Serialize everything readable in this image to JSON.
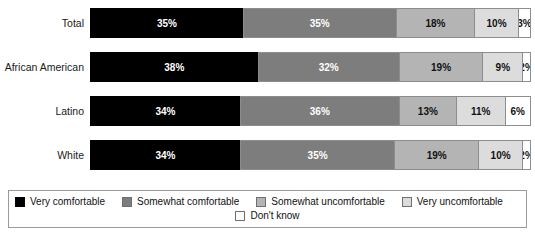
{
  "top_remnant": "",
  "chart_data": {
    "type": "bar",
    "orientation": "horizontal",
    "stacked": true,
    "normalized_percent": true,
    "title": "",
    "subtitle": "",
    "xlabel": "",
    "ylabel": "",
    "xlim": [
      0,
      100
    ],
    "grid": false,
    "legend_position": "bottom",
    "categories": [
      "Total",
      "African American",
      "Latino",
      "White"
    ],
    "series": [
      {
        "name": "Very comfortable",
        "color": "#000000",
        "values": [
          35,
          38,
          34,
          34
        ]
      },
      {
        "name": "Somewhat comfortable",
        "color": "#7d7d7d",
        "values": [
          35,
          32,
          36,
          35
        ]
      },
      {
        "name": "Somewhat uncomfortable",
        "color": "#b4b4b4",
        "values": [
          18,
          19,
          13,
          19
        ]
      },
      {
        "name": "Very uncomfortable",
        "color": "#dcdcdc",
        "values": [
          10,
          9,
          11,
          10
        ]
      },
      {
        "name": "Don't know",
        "color": "#ffffff",
        "values": [
          3,
          2,
          6,
          2
        ]
      }
    ],
    "rows": [
      {
        "label": "Total",
        "segments": [
          {
            "label": "35%",
            "value": 35,
            "series": "Very comfortable"
          },
          {
            "label": "35%",
            "value": 35,
            "series": "Somewhat comfortable"
          },
          {
            "label": "18%",
            "value": 18,
            "series": "Somewhat uncomfortable"
          },
          {
            "label": "10%",
            "value": 10,
            "series": "Very uncomfortable"
          },
          {
            "label": "3%",
            "value": 3,
            "series": "Don't know"
          }
        ]
      },
      {
        "label": "African American",
        "segments": [
          {
            "label": "38%",
            "value": 38,
            "series": "Very comfortable"
          },
          {
            "label": "32%",
            "value": 32,
            "series": "Somewhat comfortable"
          },
          {
            "label": "19%",
            "value": 19,
            "series": "Somewhat uncomfortable"
          },
          {
            "label": "9%",
            "value": 9,
            "series": "Very uncomfortable"
          },
          {
            "label": "2%",
            "value": 2,
            "series": "Don't know"
          }
        ]
      },
      {
        "label": "Latino",
        "segments": [
          {
            "label": "34%",
            "value": 34,
            "series": "Very comfortable"
          },
          {
            "label": "36%",
            "value": 36,
            "series": "Somewhat comfortable"
          },
          {
            "label": "13%",
            "value": 13,
            "series": "Somewhat uncomfortable"
          },
          {
            "label": "11%",
            "value": 11,
            "series": "Very uncomfortable"
          },
          {
            "label": "6%",
            "value": 6,
            "series": "Don't know"
          }
        ]
      },
      {
        "label": "White",
        "segments": [
          {
            "label": "34%",
            "value": 34,
            "series": "Very comfortable"
          },
          {
            "label": "35%",
            "value": 35,
            "series": "Somewhat comfortable"
          },
          {
            "label": "19%",
            "value": 19,
            "series": "Somewhat uncomfortable"
          },
          {
            "label": "10%",
            "value": 10,
            "series": "Very uncomfortable"
          },
          {
            "label": "2%",
            "value": 2,
            "series": "Don't know"
          }
        ]
      }
    ],
    "legend": [
      {
        "label": "Very comfortable",
        "color": "#000000"
      },
      {
        "label": "Somewhat comfortable",
        "color": "#7d7d7d"
      },
      {
        "label": "Somewhat uncomfortable",
        "color": "#b4b4b4"
      },
      {
        "label": "Very uncomfortable",
        "color": "#dcdcdc"
      },
      {
        "label": "Don't know",
        "color": "#ffffff"
      }
    ]
  }
}
